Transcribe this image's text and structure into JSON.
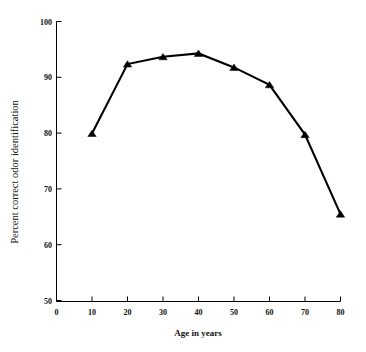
{
  "chart_data": {
    "type": "line",
    "title": "",
    "xlabel": "Age in years",
    "ylabel": "Percent correct odor identification",
    "x": [
      10,
      20,
      30,
      40,
      50,
      60,
      70,
      80
    ],
    "values": [
      80.0,
      92.4,
      93.7,
      94.3,
      91.8,
      88.7,
      79.8,
      65.6
    ],
    "series": [
      {
        "name": "Percent correct odor identification",
        "values": [
          80.0,
          92.4,
          93.7,
          94.3,
          91.8,
          88.7,
          79.8,
          65.6
        ]
      }
    ],
    "xlim": [
      0,
      80
    ],
    "ylim": [
      50,
      100
    ],
    "xticks": [
      0,
      10,
      20,
      30,
      40,
      50,
      60,
      70,
      80
    ],
    "yticks": [
      50,
      60,
      70,
      80,
      90,
      100
    ],
    "xtick_labels": [
      "0",
      "10",
      "20",
      "30",
      "40",
      "50",
      "60",
      "70",
      "80"
    ],
    "ytick_labels": [
      "50",
      "60",
      "70",
      "80",
      "90",
      "100"
    ],
    "grid": false,
    "legend": "none",
    "marker": "triangle-up",
    "line_color": "#000000",
    "marker_color": "#000000",
    "background_color": "#ffffff"
  },
  "axes": {
    "x_title": "Age in years",
    "y_title": "Percent correct odor identification"
  }
}
